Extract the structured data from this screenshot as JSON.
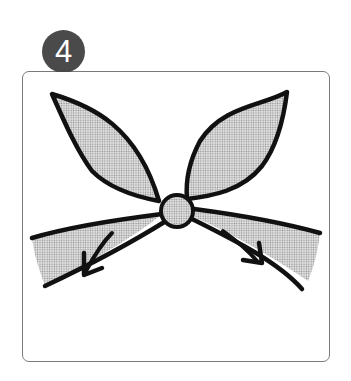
{
  "step": {
    "number": "4",
    "badge_color": "#4a4a4a",
    "badge_text_color": "#ffffff"
  },
  "illustration": {
    "subject": "bow",
    "description": "Bow with two upper loops, a round center knot, and two lower tails; arrows point down-left and down-right indicating pulling the loops tight",
    "elements": [
      "left-loop",
      "right-loop",
      "center-knot",
      "left-tail",
      "right-tail",
      "pull-arrow-left",
      "pull-arrow-right"
    ],
    "fill_pattern": "halftone-gray",
    "outline_color": "#111111",
    "frame_border_color": "#7a7a7a"
  }
}
